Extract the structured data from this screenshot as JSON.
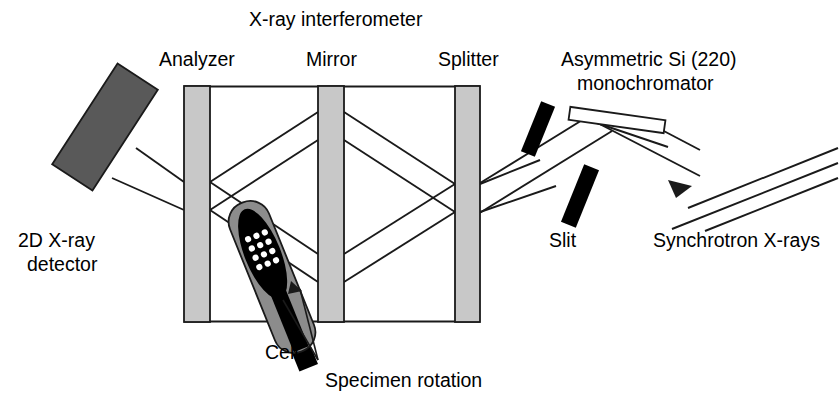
{
  "figure": {
    "title": "X-ray interferometer",
    "background_color": "#ffffff",
    "width": 839,
    "height": 406
  },
  "labels": {
    "interferometer": "X-ray interferometer",
    "analyzer": "Analyzer",
    "mirror": "Mirror",
    "splitter": "Splitter",
    "monochromator_line1": "Asymmetric Si (220)",
    "monochromator_line2": "monochromator",
    "detector_line1": "2D X-ray",
    "detector_line2": "detector",
    "cell": "Cell",
    "specimen_rotation": "Specimen rotation",
    "slit": "Slit",
    "synchrotron": "Synchrotron X-rays"
  },
  "colors": {
    "outline": "#1a1a1a",
    "blade_fill": "#c8c8c8",
    "detector_fill": "#595959",
    "cell_body": "#8c8c8c",
    "cell_core": "#000000",
    "cell_dot": "#ffffff",
    "slit_fill": "#000000",
    "mono_fill": "#ffffff",
    "beam": "#1a1a1a",
    "text": "#000000"
  },
  "components": {
    "interferometer": {
      "name": "X-ray interferometer",
      "blades": [
        {
          "name": "Analyzer",
          "x": 184,
          "y": 86,
          "width": 26,
          "height": 236
        },
        {
          "name": "Mirror",
          "x": 318,
          "y": 86,
          "width": 26,
          "height": 236
        },
        {
          "name": "Splitter",
          "x": 455,
          "y": 86,
          "width": 25,
          "height": 236
        }
      ],
      "base_y": 322,
      "top_y": 86,
      "left_x": 184,
      "right_x": 480
    },
    "detector": {
      "name": "2D X-ray detector",
      "center_x": 105,
      "center_y": 127,
      "width": 48,
      "height": 120,
      "rotation_deg": 33
    },
    "cell": {
      "name": "Cell",
      "center_x": 272,
      "center_y": 277,
      "width": 42,
      "height": 160,
      "rotation_deg": -22,
      "dot_columns": 3,
      "dot_rows": 4
    },
    "monochromator": {
      "name": "Asymmetric Si (220) monochromator",
      "center_x": 617,
      "center_y": 120,
      "width": 96,
      "height": 13,
      "rotation_deg": 8
    },
    "slits": [
      {
        "name": "upper-slit",
        "center_x": 538,
        "center_y": 129,
        "width": 15,
        "height": 54,
        "rotation_deg": 22
      },
      {
        "name": "lower-slit",
        "center_x": 580,
        "center_y": 196,
        "width": 16,
        "height": 62,
        "rotation_deg": 22
      }
    ]
  },
  "beams": {
    "incoming_ray_count": 3,
    "arrow_direction": "up-left",
    "description": "Synchrotron X-rays enter from lower right, reflect off the asymmetric Si (220) monochromator, pass the slits, then the splitter, mirror and analyzer blades before reaching the 2D X-ray detector."
  }
}
